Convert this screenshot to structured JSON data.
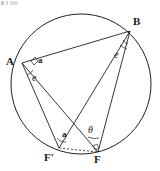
{
  "figure": {
    "type": "circle-geometry-diagram",
    "background_color": "#ffffff",
    "line_color": "#1f1f1f",
    "circle": {
      "cx": 81,
      "cy": 84,
      "r": 70
    },
    "vertices": [
      {
        "id": "A",
        "label": "A",
        "x": 22,
        "y": 63,
        "label_x": 6,
        "label_y": 58
      },
      {
        "id": "B",
        "label": "B",
        "x": 130,
        "y": 31,
        "label_x": 133,
        "label_y": 18
      },
      {
        "id": "Fprime",
        "label": "F'",
        "x": 59,
        "y": 148,
        "label_x": 45,
        "label_y": 153
      },
      {
        "id": "F",
        "label": "F",
        "x": 98,
        "y": 152,
        "label_x": 95,
        "label_y": 155
      }
    ],
    "angle_labels": [
      {
        "id": "angle-a-at-A",
        "text": "a",
        "x": 37,
        "y": 60,
        "style": "upright"
      },
      {
        "id": "angle-e-at-A",
        "text": "e",
        "x": 32,
        "y": 76,
        "style": "italic"
      },
      {
        "id": "angle-e-at-B",
        "text": "e",
        "x": 114,
        "y": 52,
        "style": "italic"
      },
      {
        "id": "angle-a-at-Fprime",
        "text": "a",
        "x": 61,
        "y": 132,
        "style": "upright"
      },
      {
        "id": "angle-theta-at-F",
        "text": "θ",
        "x": 88,
        "y": 128,
        "style": "italic"
      }
    ],
    "segments": [
      {
        "id": "chord-A-B",
        "from": "A",
        "to": "B",
        "style": "solid"
      },
      {
        "id": "chord-A-Fprime",
        "from": "A",
        "to": "Fprime",
        "style": "solid"
      },
      {
        "id": "chord-A-F",
        "from": "A",
        "to": "F",
        "style": "solid"
      },
      {
        "id": "chord-B-Fprime",
        "from": "B",
        "to": "Fprime",
        "style": "solid"
      },
      {
        "id": "chord-B-F",
        "from": "B",
        "to": "F",
        "style": "solid"
      },
      {
        "id": "chord-Fprime-F",
        "from": "Fprime",
        "to": "F",
        "style": "dashed"
      }
    ]
  }
}
